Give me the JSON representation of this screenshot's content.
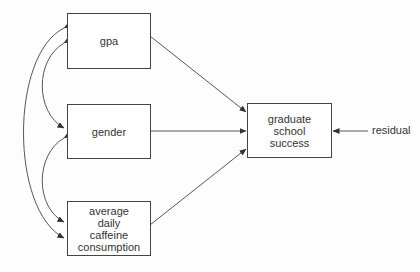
{
  "diagram": {
    "type": "path diagram",
    "predictors": [
      {
        "id": "gpa",
        "label": "gpa"
      },
      {
        "id": "gender",
        "label": "gender"
      },
      {
        "id": "caffeine",
        "label": "average\ndaily\ncaffeine\nconsumption"
      }
    ],
    "outcome": {
      "id": "success",
      "label": "graduate\nschool\nsuccess"
    },
    "residual": {
      "label": "residual"
    },
    "edges": [
      {
        "from": "gpa",
        "to": "success",
        "type": "directed"
      },
      {
        "from": "gender",
        "to": "success",
        "type": "directed"
      },
      {
        "from": "caffeine",
        "to": "success",
        "type": "directed"
      },
      {
        "from": "residual",
        "to": "success",
        "type": "directed"
      },
      {
        "from": "gpa",
        "to": "caffeine",
        "type": "bidirectional"
      },
      {
        "from": "gpa",
        "to": "gender",
        "type": "bidirectional"
      },
      {
        "from": "gender",
        "to": "caffeine",
        "type": "bidirectional"
      }
    ],
    "colors": {
      "line": "#444444",
      "text": "#333333",
      "background": "#fdfdfd"
    }
  }
}
